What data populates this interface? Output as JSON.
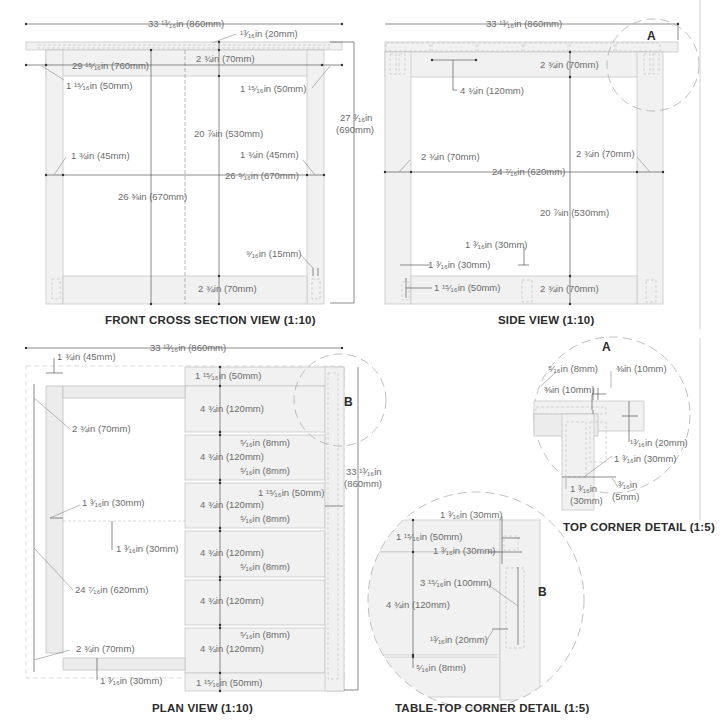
{
  "views": {
    "front": {
      "caption": "FRONT CROSS SECTION VIEW (1:10)",
      "dims": {
        "overall_width": "33 ¹³⁄₁₆in (860mm)",
        "top_thickness": "¹³⁄₁₆in (20mm)",
        "inner_width": "29 ¹⁵⁄₁₆in (760mm)",
        "apron_height": "2 ¾in (70mm)",
        "left_offset": "1 ¹⁵⁄₁₆in (50mm)",
        "right_offset": "1 ¹⁵⁄₁₆in (50mm)",
        "overall_height": "27 ³⁄₁₆in",
        "overall_height_mm": "(690mm)",
        "leg_gap_height": "20 ⅞in (530mm)",
        "left_leg": "1 ¾in (45mm)",
        "right_leg": "1 ¾in (45mm)",
        "between_legs": "26 ⁵⁄₁₆in (670mm)",
        "inner_span": "26 ⅜in (670mm)",
        "tenon_gap": "⁹⁄₁₆in (15mm)",
        "stretcher_height": "2 ¾in (70mm)"
      }
    },
    "side": {
      "caption": "SIDE VIEW (1:10)",
      "dims": {
        "overall_width": "33 ¹³⁄₁₆in (860mm)",
        "apron_height": "2 ¾in (70mm)",
        "slat_width": "4 ¾in (120mm)",
        "left_leg": "2 ¾in (70mm)",
        "right_leg": "2 ¾in (70mm)",
        "between_legs": "24 ⁷⁄₁₆in (620mm)",
        "leg_gap_height": "20 ⅞in (530mm)",
        "mortise_width": "1 ³⁄₁₆in (30mm)",
        "leg_offset": "1 ³⁄₁₆in (30mm)",
        "tenon_height": "1 ¹⁵⁄₁₆in (50mm)",
        "stretcher_height": "2 ¾in (70mm)"
      },
      "detail_marker": "A"
    },
    "plan": {
      "caption": "PLAN VIEW (1:10)",
      "dims": {
        "overall_width": "33 ¹³⁄₁₆in (860mm)",
        "leg_width": "1 ¾in (45mm)",
        "leg_depth": "2 ¾in (70mm)",
        "end_board_top": "1 ¹⁵⁄₁₆in (50mm)",
        "slats": [
          "4 ¾in (120mm)",
          "4 ¾in (120mm)",
          "4 ¾in (120mm)",
          "4 ¾in (120mm)",
          "4 ¾in (120mm)",
          "4 ¾in (120mm)"
        ],
        "gaps": [
          "⁵⁄₁₆in (8mm)",
          "⁵⁄₁₆in (8mm)",
          "⁵⁄₁₆in (8mm)",
          "⁵⁄₁₆in (8mm)",
          "⁵⁄₁₆in (8mm)"
        ],
        "end_board_bottom": "1 ¹⁵⁄₁₆in (50mm)",
        "overall_depth": "33 ¹³⁄₁₆in",
        "overall_depth_mm": "(860mm)",
        "side_offset": "1 ¹⁵⁄₁₆in (50mm)",
        "stretcher_offset": "1 ³⁄₁₆in (30mm)",
        "stretcher_inset": "1 ³⁄₁₆in (30mm)",
        "between_legs": "24 ⁷⁄₁₆in (620mm)",
        "leg_depth_bottom": "2 ¾in (70mm)",
        "bottom_offset": "1 ³⁄₁₆in (30mm)"
      },
      "detail_marker": "B"
    },
    "top_corner": {
      "caption": "TOP CORNER DETAIL (1:5)",
      "marker": "A",
      "dims": {
        "gap_8": "⁵⁄₁₆in (8mm)",
        "gap_10a": "⅜in (10mm)",
        "gap_10b": "⅜in (10mm)",
        "thickness": "¹³⁄₁₆in (20mm)",
        "tenon_30": "1 ³⁄₁₆in (30mm)",
        "tenon_30b": "1 ³⁄₁₆in",
        "tenon_30b_mm": "(30mm)",
        "gap_5": "³⁄₁₆in",
        "gap_5_mm": "(5mm)"
      }
    },
    "tabletop_corner": {
      "caption": "TABLE-TOP CORNER DETAIL (1:5)",
      "marker": "B",
      "dims": {
        "top_30": "1 ³⁄₁₆in (30mm)",
        "end_50": "1 ¹⁵⁄₁₆in (50mm)",
        "inset_30": "1 ³⁄₁₆in (30mm)",
        "tongue_100": "3 ¹⁵⁄₁₆in (100mm)",
        "slat_120": "4 ¾in (120mm)",
        "tongue_20": "¹³⁄₁₆in (20mm)",
        "gap_8": "⁵⁄₁₆in (8mm)"
      }
    }
  }
}
